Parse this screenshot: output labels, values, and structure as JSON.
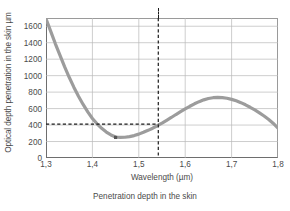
{
  "chart_data": {
    "type": "line",
    "title": "",
    "caption": "Penetration depth in the skin",
    "xlabel": "Wavelength (µm)",
    "ylabel": "Optical depth penetration in the skin µm",
    "xlim": [
      1.3,
      1.8
    ],
    "ylim": [
      0,
      1700
    ],
    "grid": true,
    "legend": "none",
    "x_ticks": [
      "1,3",
      "1,4",
      "1,5",
      "1,6",
      "1,7",
      "1,8"
    ],
    "x_tick_values": [
      1.3,
      1.4,
      1.5,
      1.6,
      1.7,
      1.8
    ],
    "y_ticks": [
      "0",
      "200",
      "400",
      "600",
      "800",
      "1000",
      "1200",
      "1400",
      "1600"
    ],
    "y_tick_values": [
      0,
      200,
      400,
      600,
      800,
      1000,
      1200,
      1400,
      1600
    ],
    "series": [
      {
        "name": "Optical penetration depth",
        "color": "#9c9c9c",
        "x": [
          1.3,
          1.31,
          1.32,
          1.33,
          1.34,
          1.35,
          1.36,
          1.37,
          1.38,
          1.39,
          1.4,
          1.41,
          1.42,
          1.43,
          1.44,
          1.45,
          1.46,
          1.47,
          1.48,
          1.49,
          1.5,
          1.51,
          1.52,
          1.53,
          1.54,
          1.55,
          1.56,
          1.57,
          1.58,
          1.59,
          1.6,
          1.61,
          1.62,
          1.63,
          1.64,
          1.65,
          1.66,
          1.67,
          1.68,
          1.69,
          1.7,
          1.71,
          1.72,
          1.73,
          1.74,
          1.75,
          1.76,
          1.77,
          1.78,
          1.79,
          1.8
        ],
        "values": [
          1690,
          1540,
          1390,
          1250,
          1110,
          980,
          860,
          750,
          650,
          560,
          480,
          415,
          360,
          315,
          280,
          255,
          250,
          252,
          260,
          272,
          290,
          312,
          336,
          362,
          392,
          424,
          458,
          492,
          528,
          562,
          596,
          628,
          658,
          684,
          706,
          722,
          732,
          736,
          734,
          726,
          712,
          694,
          672,
          646,
          616,
          584,
          548,
          510,
          468,
          420,
          362
        ]
      }
    ],
    "markers": [
      {
        "name": "minimum-point",
        "x": 1.45,
        "y": 250,
        "color": "#555555"
      }
    ],
    "annotations": [
      {
        "name": "vertical-reference-line",
        "type": "vline",
        "x": 1.542,
        "style": "dashed",
        "color": "#1a1a1a"
      },
      {
        "name": "horizontal-reference-line",
        "type": "hline",
        "y": 412,
        "x_start": 1.3,
        "x_end": 1.542,
        "style": "dashed",
        "color": "#1a1a1a"
      }
    ]
  }
}
